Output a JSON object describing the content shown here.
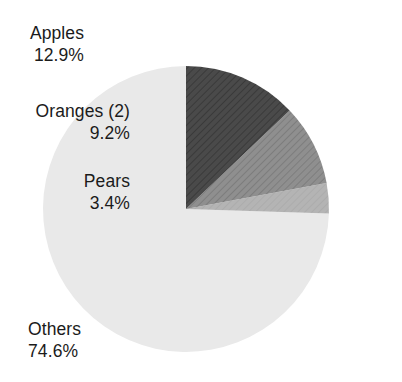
{
  "chart_data": {
    "type": "pie",
    "title": "",
    "subtitle": "",
    "xlabel": "",
    "ylabel": "",
    "legend_position": "callout-labels",
    "grid": false,
    "start_angle_deg": 0,
    "direction": "clockwise",
    "categories": [
      "Apples",
      "Oranges (2)",
      "Pears",
      "Others"
    ],
    "values": [
      12.9,
      9.2,
      3.4,
      74.6
    ],
    "value_unit": "%",
    "slices": [
      {
        "name": "apples",
        "label": "Apples",
        "value": 12.9,
        "value_text": "12.9%",
        "color": "#4a4a4a",
        "hatched": true,
        "start_deg": 0.0,
        "end_deg": 46.44
      },
      {
        "name": "oranges",
        "label": "Oranges (2)",
        "value": 9.2,
        "value_text": "9.2%",
        "color": "#8b8b8b",
        "hatched": true,
        "start_deg": 46.44,
        "end_deg": 79.56
      },
      {
        "name": "pears",
        "label": "Pears",
        "value": 3.4,
        "value_text": "3.4%",
        "color": "#b2b2b2",
        "hatched": false,
        "start_deg": 79.56,
        "end_deg": 91.8
      },
      {
        "name": "others",
        "label": "Others",
        "value": 74.6,
        "value_text": "74.6%",
        "color": "#e9e9e9",
        "hatched": false,
        "start_deg": 91.8,
        "end_deg": 360.0
      }
    ]
  },
  "colors": {
    "background": "#ffffff",
    "text": "#1b1b1b",
    "apples": "#4a4a4a",
    "oranges": "#8b8b8b",
    "pears": "#b2b2b2",
    "others": "#e9e9e9"
  }
}
